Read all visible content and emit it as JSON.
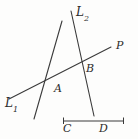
{
  "figure": {
    "kind": "geometry-line-diagram",
    "background_color": "#fdfdfc",
    "stroke_color": "#3a3a3a",
    "labels": {
      "line1_base": "L",
      "line1_sub": "1",
      "line2_base": "L",
      "line2_sub": "2",
      "ray_end": "P",
      "point_upper": "B",
      "point_lower": "A",
      "segment_left": "C",
      "segment_right": "D"
    },
    "geometry": {
      "transversal_L1": {
        "x1": 9,
        "y1": 99,
        "x2": 111,
        "y2": 47
      },
      "left_line": {
        "x1": 62,
        "y1": 21,
        "x2": 34,
        "y2": 119
      },
      "line_L2": {
        "x1": 71,
        "y1": 11,
        "x2": 94,
        "y2": 116
      },
      "segment_CD": {
        "x1": 63,
        "y1": 121,
        "x2": 124,
        "y2": 121
      },
      "segment_tick_left": {
        "x1": 63,
        "y1": 117,
        "x2": 63,
        "y2": 124
      },
      "segment_tick_right": {
        "x1": 124,
        "y1": 117,
        "x2": 124,
        "y2": 124
      },
      "intersection_A": {
        "x": 48,
        "y": 79
      },
      "intersection_B": {
        "x": 82,
        "y": 62
      }
    }
  }
}
